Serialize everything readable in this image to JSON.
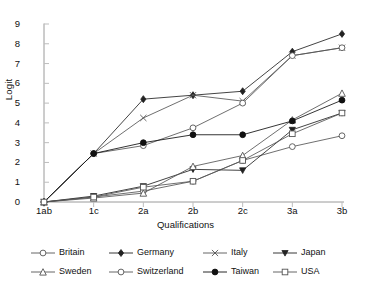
{
  "chart_data": {
    "type": "line",
    "title": "",
    "subtitle": "",
    "xlabel": "Qualifications",
    "ylabel": "Logit",
    "categories": [
      "1ab",
      "1c",
      "2a",
      "2b",
      "2c",
      "3a",
      "3b"
    ],
    "ylim": [
      0,
      9
    ],
    "yticks": [
      0,
      1,
      2,
      3,
      4,
      5,
      6,
      7,
      8,
      9
    ],
    "grid": false,
    "legend_position": "bottom",
    "series": [
      {
        "name": "Britain",
        "marker": "open-circle",
        "color": "#555555",
        "values": [
          0,
          0.25,
          0.55,
          1.05,
          2.1,
          2.8,
          3.35
        ]
      },
      {
        "name": "Germany",
        "marker": "filled-diamond",
        "color": "#222222",
        "values": [
          0,
          2.45,
          5.2,
          5.4,
          5.6,
          7.6,
          8.5
        ]
      },
      {
        "name": "Italy",
        "marker": "cross-x",
        "color": "#555555",
        "values": [
          0,
          2.45,
          4.25,
          5.4,
          5.1,
          7.4,
          7.8
        ]
      },
      {
        "name": "Japan",
        "marker": "filled-triangle-down",
        "color": "#222222",
        "values": [
          0,
          0.3,
          0.8,
          1.65,
          1.6,
          3.65,
          4.5
        ]
      },
      {
        "name": "Sweden",
        "marker": "open-triangle-up",
        "color": "#555555",
        "values": [
          0,
          0.2,
          0.45,
          1.8,
          2.35,
          4.15,
          5.5
        ]
      },
      {
        "name": "Switzerland",
        "marker": "open-circle",
        "color": "#555555",
        "values": [
          0,
          2.45,
          2.85,
          3.75,
          5.0,
          7.4,
          7.8
        ]
      },
      {
        "name": "Taiwan",
        "marker": "filled-circle",
        "color": "#111111",
        "values": [
          0,
          2.45,
          3.0,
          3.4,
          3.4,
          4.1,
          5.15
        ]
      },
      {
        "name": "USA",
        "marker": "open-square",
        "color": "#555555",
        "values": [
          0,
          0.25,
          0.75,
          1.05,
          2.1,
          3.45,
          4.5
        ]
      }
    ]
  },
  "legend": {
    "rows": [
      [
        "Britain",
        "Germany",
        "Italy",
        "Japan"
      ],
      [
        "Sweden",
        "Switzerland",
        "Taiwan",
        "USA"
      ]
    ]
  }
}
